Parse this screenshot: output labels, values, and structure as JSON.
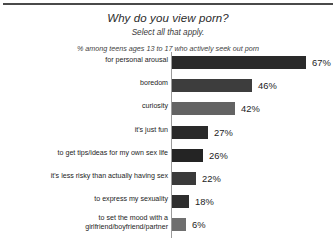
{
  "chart_data": {
    "type": "bar",
    "title": "Why do you view porn?",
    "subtitle": "Select all that apply.",
    "note": "% among teens ages 13 to 17 who actively seek out porn",
    "orientation": "horizontal",
    "xlabel": "",
    "ylabel": "",
    "grid": false,
    "legend": "none",
    "value_suffix": "%",
    "categories": [
      "for personal arousal",
      "boredom",
      "curiosity",
      "it's just fun",
      "to get tips/ideas for my own sex life",
      "it's less risky than actually having sex",
      "to express my sexuality",
      "to set the mood with a girlfriend/boyfriend/partner"
    ],
    "values": [
      67,
      46,
      42,
      27,
      26,
      22,
      18,
      6
    ],
    "value_labels": [
      "67%",
      "46%",
      "42%",
      "27%",
      "26%",
      "22%",
      "18%",
      "6%"
    ],
    "bars": [
      {
        "label": "for personal arousal",
        "value": 67,
        "value_label": "67%",
        "bar_px": 134,
        "color": "#2a2a2a",
        "top": 4,
        "label_lines": [
          "for personal arousal"
        ]
      },
      {
        "label": "boredom",
        "value": 46,
        "value_label": "46%",
        "bar_px": 80,
        "color": "#3d3d3d",
        "top": 27,
        "label_lines": [
          "boredom"
        ]
      },
      {
        "label": "curiosity",
        "value": 42,
        "value_label": "42%",
        "bar_px": 63,
        "color": "#636363",
        "top": 50,
        "label_lines": [
          "curiosity"
        ]
      },
      {
        "label": "it's just fun",
        "value": 27,
        "value_label": "27%",
        "bar_px": 36,
        "color": "#2a2a2a",
        "top": 74,
        "label_lines": [
          "it's just fun"
        ]
      },
      {
        "label": "to get tips/ideas for my own sex life",
        "value": 26,
        "value_label": "26%",
        "bar_px": 31,
        "color": "#242424",
        "top": 97,
        "label_lines": [
          "to get tips/ideas for my own sex life"
        ]
      },
      {
        "label": "it's less risky than actually having sex",
        "value": 22,
        "value_label": "22%",
        "bar_px": 24,
        "color": "#3a3a3a",
        "top": 120,
        "label_lines": [
          "it's less risky than actually having sex"
        ]
      },
      {
        "label": "to express my sexuality",
        "value": 18,
        "value_label": "18%",
        "bar_px": 17,
        "color": "#2e2e2e",
        "top": 143,
        "label_lines": [
          "to express my sexuality"
        ]
      },
      {
        "label": "to set the mood with a girlfriend/boyfriend/partner",
        "value": 6,
        "value_label": "6%",
        "bar_px": 14,
        "color": "#6f6f6f",
        "top": 166,
        "label_lines": [
          "to set the mood with a",
          "girlfriend/boyfriend/partner"
        ]
      }
    ],
    "colors": {
      "background": "#ffffff",
      "text": "#1c1c1c",
      "axis": "#9b9b9b",
      "rule": "#4a4a4a",
      "bar_dark": "#2a2a2a",
      "bar_light": "#636363"
    }
  }
}
